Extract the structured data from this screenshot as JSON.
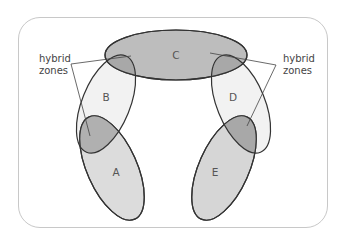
{
  "diagram": {
    "type": "ring-species",
    "populations": [
      {
        "id": "A",
        "label": "A"
      },
      {
        "id": "B",
        "label": "B"
      },
      {
        "id": "C",
        "label": "C"
      },
      {
        "id": "D",
        "label": "D"
      },
      {
        "id": "E",
        "label": "E"
      }
    ],
    "annotations": {
      "left": {
        "line1": "hybrid",
        "line2": "zones"
      },
      "right": {
        "line1": "hybrid",
        "line2": "zones"
      }
    },
    "colors": {
      "frame_border": "#c8c8c8",
      "outline": "#333333",
      "light_fill": "#f0f0f0",
      "mid_fill": "#d9d9d9",
      "dark_fill": "#bdbdbd",
      "overlap_fill": "#a9a9a9",
      "text": "#555555"
    }
  }
}
